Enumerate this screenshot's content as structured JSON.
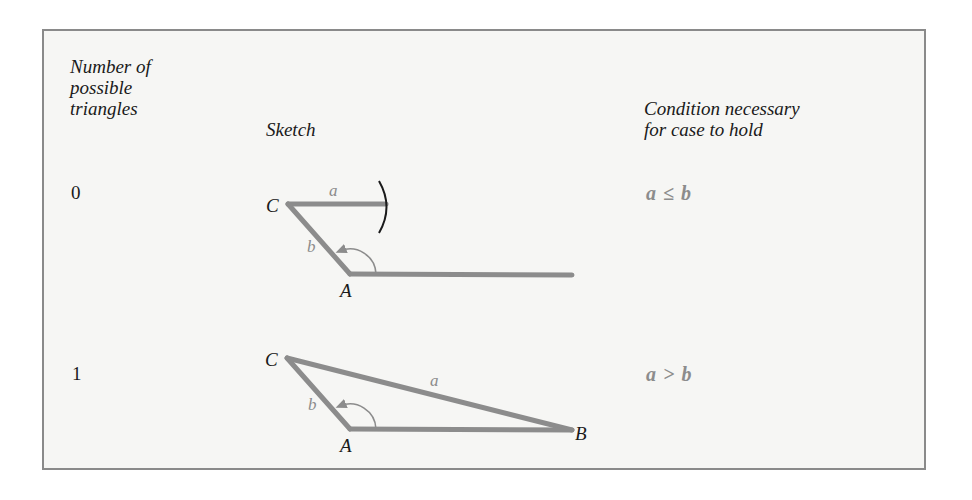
{
  "table": {
    "headers": {
      "count": "Number of\npossible\ntriangles",
      "sketch": "Sketch",
      "condition": "Condition necessary\nfor case to hold"
    },
    "rows": [
      {
        "count": "0",
        "sketch": {
          "vertices": {
            "C": "C",
            "A": "A"
          },
          "sides": {
            "a": "a",
            "b": "b"
          },
          "description": "Side a too short to reach base line; arc does not intersect"
        },
        "condition": "a ≤ b"
      },
      {
        "count": "1",
        "sketch": {
          "vertices": {
            "C": "C",
            "A": "A",
            "B": "B"
          },
          "sides": {
            "a": "a",
            "b": "b"
          },
          "description": "Obtuse angle A; side a reaches base at B forming one triangle"
        },
        "condition": "a > b"
      }
    ]
  },
  "colors": {
    "line": "#8c8c8c",
    "arc": "#1a1a1a",
    "border": "#8a8a8a",
    "panel_bg": "#f6f6f4"
  }
}
